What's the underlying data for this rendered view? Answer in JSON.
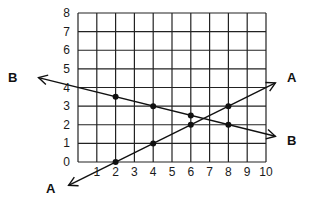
{
  "chart_data": {
    "type": "line",
    "title": "",
    "xlabel": "",
    "ylabel": "",
    "xlim": [
      0,
      10
    ],
    "ylim": [
      0,
      8
    ],
    "grid": true,
    "x_ticks": [
      "1",
      "2",
      "3",
      "4",
      "5",
      "6",
      "7",
      "8",
      "9",
      "10"
    ],
    "y_ticks": [
      "0",
      "1",
      "2",
      "3",
      "4",
      "5",
      "6",
      "7",
      "8"
    ],
    "series": [
      {
        "name": "A",
        "equation": "y = 0.5x - 1",
        "points": [
          [
            2,
            0
          ],
          [
            4,
            1
          ],
          [
            6,
            2
          ],
          [
            8,
            3
          ]
        ],
        "extends_from": [
          -0.5,
          -1.25
        ],
        "extends_to": [
          10.5,
          4.25
        ]
      },
      {
        "name": "B",
        "equation": "y = 4 - 0.25x",
        "points": [
          [
            2,
            3.5
          ],
          [
            4,
            3
          ],
          [
            6,
            2.5
          ],
          [
            8,
            2
          ]
        ],
        "extends_from": [
          -2.1,
          4.53
        ],
        "extends_to": [
          10.5,
          1.38
        ]
      }
    ],
    "legend": "none (line labels 'A' and 'B' at arrowheads)"
  },
  "labels": {
    "line_a_start": "A",
    "line_a_end": "A",
    "line_b_start": "B",
    "line_b_end": "B"
  }
}
